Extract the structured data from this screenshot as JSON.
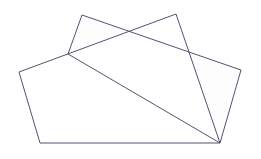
{
  "figure": {
    "title": "Two overlapping quadrilaterals",
    "width": 261,
    "height": 159,
    "background_color": "#ffffff",
    "stroke_color": "#565070",
    "stroke_width": 1,
    "shapes": [
      {
        "name": "large-quadrilateral",
        "label": "Large left quadrilateral",
        "sides": 4,
        "fill_color": "#ffffff",
        "points": "19,72 176,14 220,143 40,143",
        "vertices": [
          {
            "label": "left",
            "x": 19,
            "y": 72
          },
          {
            "label": "top-right",
            "x": 176,
            "y": 14
          },
          {
            "label": "bottom-right",
            "x": 220,
            "y": 143
          },
          {
            "label": "bottom-left",
            "x": 40,
            "y": 143
          }
        ]
      },
      {
        "name": "tilted-quadrilateral",
        "label": "Tilted overlapping quadrilateral",
        "sides": 4,
        "fill_color": "#fdfdfe",
        "points": "82,15 241,70 220,143 68,54",
        "vertices": [
          {
            "label": "top-apex",
            "x": 82,
            "y": 15
          },
          {
            "label": "right",
            "x": 241,
            "y": 70
          },
          {
            "label": "bottom",
            "x": 220,
            "y": 143
          },
          {
            "label": "left-lower",
            "x": 68,
            "y": 54
          }
        ]
      }
    ],
    "intersections": [
      {
        "name": "upper-left-crossing",
        "x": 68,
        "y": 54
      },
      {
        "name": "upper-mid-crossing",
        "x": 128,
        "y": 34
      },
      {
        "name": "right-crossing",
        "x": 188,
        "y": 53
      },
      {
        "name": "bottom-shared-vertex",
        "x": 220,
        "y": 143
      }
    ]
  }
}
